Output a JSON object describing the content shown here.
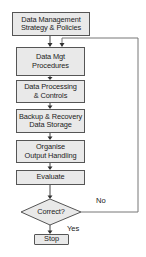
{
  "diagram": {
    "type": "flowchart",
    "nodes": [
      {
        "id": "n1",
        "label": "Data Management\nStrategy & Policies",
        "shape": "rectangle"
      },
      {
        "id": "n2",
        "label": "Data Mgt\nProcedures",
        "shape": "rectangle"
      },
      {
        "id": "n3",
        "label": "Data Processing\n& Controls",
        "shape": "rectangle"
      },
      {
        "id": "n4",
        "label": "Backup & Recovery\nData Storage",
        "shape": "rectangle"
      },
      {
        "id": "n5",
        "label": "Organise\nOutput Handling",
        "shape": "rectangle"
      },
      {
        "id": "n6",
        "label": "Evaluate",
        "shape": "rectangle"
      },
      {
        "id": "n7",
        "label": "Correct?",
        "shape": "diamond"
      },
      {
        "id": "n8",
        "label": "Stop",
        "shape": "rectangle"
      }
    ],
    "edges": [
      {
        "from": "n1",
        "to": "n2",
        "label": ""
      },
      {
        "from": "n2",
        "to": "n3",
        "label": ""
      },
      {
        "from": "n3",
        "to": "n4",
        "label": ""
      },
      {
        "from": "n4",
        "to": "n5",
        "label": ""
      },
      {
        "from": "n5",
        "to": "n6",
        "label": ""
      },
      {
        "from": "n6",
        "to": "n7",
        "label": ""
      },
      {
        "from": "n7",
        "to": "n8",
        "label": "Yes"
      },
      {
        "from": "n7",
        "to": "n2",
        "label": "No"
      }
    ],
    "edge_labels": {
      "yes": "Yes",
      "no": "No"
    },
    "colors": {
      "box_fill": "#e9e9e9",
      "stroke": "#555555",
      "text": "#222222"
    }
  }
}
